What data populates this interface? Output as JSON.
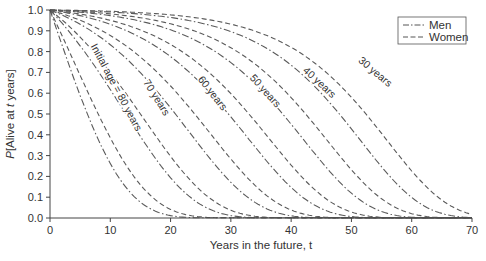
{
  "chart_data": {
    "type": "line",
    "title": "",
    "xlabel": "Years in the future, t",
    "ylabel": "P[Alive at t years]",
    "xlim": [
      0,
      70
    ],
    "ylim": [
      0.0,
      1.0
    ],
    "xticks": [
      "0",
      "10",
      "20",
      "30",
      "40",
      "50",
      "60",
      "70"
    ],
    "yticks": [
      "0.0",
      "0.1",
      "0.2",
      "0.3",
      "0.4",
      "0.5",
      "0.6",
      "0.7",
      "0.8",
      "0.9",
      "1.0"
    ],
    "grid": false,
    "legend": {
      "position": "top-right",
      "entries": [
        {
          "label": "Men",
          "style": "dash-dot"
        },
        {
          "label": "Women",
          "style": "dashed"
        }
      ]
    },
    "annotations": [
      {
        "text": "Initial age = 80 years",
        "x": 10.5,
        "y": 0.62,
        "rotation": 62
      },
      {
        "text": "70 years",
        "x": 17.2,
        "y": 0.57,
        "rotation": 58
      },
      {
        "text": "60 years",
        "x": 26.5,
        "y": 0.59,
        "rotation": 52
      },
      {
        "text": "50 years",
        "x": 35.3,
        "y": 0.6,
        "rotation": 48
      },
      {
        "text": "40 years",
        "x": 44.3,
        "y": 0.64,
        "rotation": 43
      },
      {
        "text": "30 years",
        "x": 53.6,
        "y": 0.69,
        "rotation": 40
      }
    ],
    "series": [
      {
        "name": "Men, initial age 80",
        "group": "Men",
        "initial_age": 80,
        "median_t": 6.2,
        "x": [
          0,
          5,
          10,
          15,
          20,
          25,
          30
        ],
        "values": [
          1.0,
          0.59,
          0.24,
          0.06,
          0.01,
          0.0,
          0.0
        ]
      },
      {
        "name": "Women, initial age 80",
        "group": "Women",
        "initial_age": 80,
        "median_t": 8.0,
        "x": [
          0,
          5,
          10,
          15,
          20,
          25,
          30
        ],
        "values": [
          1.0,
          0.7,
          0.36,
          0.11,
          0.02,
          0.0,
          0.0
        ]
      },
      {
        "name": "Men, initial age 70",
        "group": "Men",
        "initial_age": 70,
        "median_t": 12.6,
        "x": [
          0,
          5,
          10,
          15,
          20,
          25,
          30
        ],
        "values": [
          1.0,
          0.89,
          0.66,
          0.37,
          0.13,
          0.02,
          0.0
        ]
      },
      {
        "name": "Women, initial age 70",
        "group": "Women",
        "initial_age": 70,
        "median_t": 15.0,
        "x": [
          0,
          5,
          10,
          15,
          20,
          25,
          30
        ],
        "values": [
          1.0,
          0.93,
          0.78,
          0.5,
          0.22,
          0.05,
          0.0
        ]
      },
      {
        "name": "Men, initial age 60",
        "group": "Men",
        "initial_age": 60,
        "median_t": 20.8,
        "x": [
          0,
          10,
          15,
          20,
          25,
          30,
          35
        ],
        "values": [
          1.0,
          0.87,
          0.73,
          0.53,
          0.28,
          0.09,
          0.01
        ]
      },
      {
        "name": "Women, initial age 60",
        "group": "Women",
        "initial_age": 60,
        "median_t": 24.0,
        "x": [
          0,
          10,
          15,
          20,
          25,
          30,
          35
        ],
        "values": [
          1.0,
          0.93,
          0.84,
          0.68,
          0.45,
          0.19,
          0.04
        ]
      },
      {
        "name": "Men, initial age 50",
        "group": "Men",
        "initial_age": 50,
        "median_t": 29.6,
        "x": [
          0,
          10,
          20,
          25,
          30,
          35,
          40,
          45
        ],
        "values": [
          1.0,
          0.95,
          0.8,
          0.66,
          0.48,
          0.25,
          0.08,
          0.01
        ]
      },
      {
        "name": "Women, initial age 50",
        "group": "Women",
        "initial_age": 50,
        "median_t": 33.0,
        "x": [
          0,
          10,
          20,
          25,
          30,
          35,
          40,
          45
        ],
        "values": [
          1.0,
          0.97,
          0.89,
          0.79,
          0.63,
          0.41,
          0.17,
          0.03
        ]
      },
      {
        "name": "Men, initial age 40",
        "group": "Men",
        "initial_age": 40,
        "median_t": 38.6,
        "x": [
          0,
          10,
          20,
          30,
          35,
          40,
          45,
          50
        ],
        "values": [
          1.0,
          0.98,
          0.93,
          0.78,
          0.64,
          0.45,
          0.22,
          0.06
        ]
      },
      {
        "name": "Women, initial age 40",
        "group": "Women",
        "initial_age": 40,
        "median_t": 42.4,
        "x": [
          0,
          10,
          20,
          30,
          35,
          40,
          45,
          50
        ],
        "values": [
          1.0,
          0.99,
          0.96,
          0.87,
          0.77,
          0.6,
          0.37,
          0.13
        ]
      },
      {
        "name": "Men, initial age 30",
        "group": "Men",
        "initial_age": 30,
        "median_t": 48.0,
        "x": [
          0,
          10,
          20,
          30,
          40,
          45,
          50,
          55,
          60,
          70
        ],
        "values": [
          1.0,
          0.99,
          0.97,
          0.92,
          0.76,
          0.61,
          0.42,
          0.2,
          0.06,
          0.01
        ]
      },
      {
        "name": "Women, initial age 30",
        "group": "Women",
        "initial_age": 30,
        "median_t": 52.4,
        "x": [
          0,
          10,
          20,
          30,
          40,
          45,
          50,
          55,
          60,
          70
        ],
        "values": [
          1.0,
          0.995,
          0.98,
          0.95,
          0.85,
          0.75,
          0.58,
          0.37,
          0.15,
          0.02
        ]
      }
    ]
  }
}
